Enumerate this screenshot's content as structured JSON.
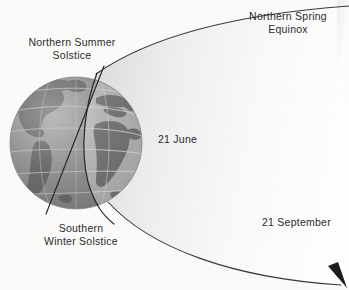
{
  "figure": {
    "kind": "astronomy-seasons-diagram",
    "background_color": "#fbfbfa",
    "ink_color": "#2b2b2b"
  },
  "labels": {
    "northern_spring_equinox": "Northern Spring\nEquinox",
    "northern_summer_solstice": "Northern Summer\nSolstice",
    "southern_winter_solstice": "Southern\nWinter Solstice",
    "date_june": "21 June",
    "date_september": "21 September"
  },
  "globe": {
    "center_x": 76,
    "center_y": 143,
    "radius": 66,
    "ocean_color": "#9b9b9b",
    "land_color": "#6e6e6e",
    "lit_color": "#b9b9b9",
    "shadow_color": "#7e7e7e",
    "graticule_color": "#c9c9c9"
  },
  "orbit": {
    "fill_start": "#e3e3e3",
    "fill_end": "#ffffff",
    "stroke": "#3a3a3a",
    "stroke_width": 1.1,
    "arrow_color": "#1c1c1c"
  },
  "axis_line": {
    "stroke": "#2a2a2a",
    "stroke_width": 1.2
  },
  "terminator": {
    "stroke": "#2a2a2a",
    "stroke_width": 1.2
  }
}
